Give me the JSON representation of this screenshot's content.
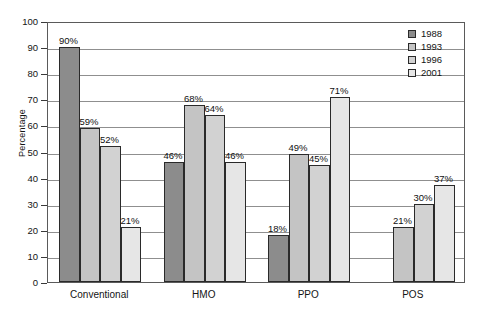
{
  "chart_data": {
    "type": "bar",
    "title": "",
    "xlabel": "",
    "ylabel": "Percentage",
    "ylim": [
      0,
      100
    ],
    "ytick_step": 10,
    "ytick_labels": [
      "0",
      "10",
      "20",
      "30",
      "40",
      "50",
      "60",
      "70",
      "80",
      "90",
      "100"
    ],
    "grid": true,
    "legend_position": "top-right",
    "categories": [
      "Conventional",
      "HMO",
      "PPO",
      "POS"
    ],
    "series": [
      {
        "name": "1988",
        "color": "#8c8c8c",
        "values": [
          90,
          46,
          18,
          null
        ],
        "labels": [
          "90%",
          "46%",
          "18%",
          ""
        ]
      },
      {
        "name": "1993",
        "color": "#c4c4c4",
        "values": [
          59,
          68,
          49,
          21
        ],
        "labels": [
          "59%",
          "68%",
          "49%",
          "21%"
        ]
      },
      {
        "name": "1996",
        "color": "#d2d2d2",
        "values": [
          52,
          64,
          45,
          30
        ],
        "labels": [
          "52%",
          "64%",
          "45%",
          "30%"
        ]
      },
      {
        "name": "2001",
        "color": "#e6e6e6",
        "values": [
          21,
          46,
          71,
          37
        ],
        "labels": [
          "21%",
          "46%",
          "71%",
          "37%"
        ]
      }
    ]
  },
  "legend": {
    "items": [
      {
        "label": "1988"
      },
      {
        "label": "1993"
      },
      {
        "label": "1996"
      },
      {
        "label": "2001"
      }
    ]
  },
  "axes": {
    "y_title": "Percentage",
    "y_ticks": [
      "100",
      "90",
      "80",
      "70",
      "60",
      "50",
      "40",
      "30",
      "20",
      "10",
      "0"
    ],
    "x_categories": [
      "Conventional",
      "HMO",
      "PPO",
      "POS"
    ]
  },
  "colors": {
    "series_1988": "#8c8c8c",
    "series_1993": "#c4c4c4",
    "series_1996": "#d2d2d2",
    "series_2001": "#e6e6e6",
    "frame": "#5a5a5a",
    "gridline": "#8f8f8f",
    "bar_outline": "#2a2a2a",
    "text": "#141414",
    "background": "#ffffff"
  }
}
